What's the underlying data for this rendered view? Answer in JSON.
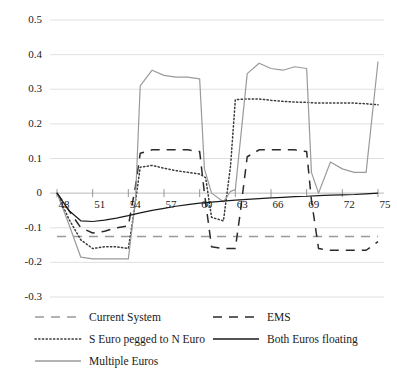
{
  "chart_data": {
    "type": "line",
    "title": "",
    "xlabel": "",
    "ylabel": "",
    "xlim": [
      48,
      75
    ],
    "ylim": [
      -0.3,
      0.5
    ],
    "grid": true,
    "legend_position": "bottom",
    "yticks": [
      "0.5",
      "0.4",
      "0.3",
      "0.2",
      "0.1",
      "0",
      "-0.1",
      "-0.2",
      "-0.3"
    ],
    "ytick_values": [
      0.5,
      0.4,
      0.3,
      0.2,
      0.1,
      0,
      -0.1,
      -0.2,
      -0.3
    ],
    "xticks": [
      "48",
      "51",
      "54",
      "57",
      "60",
      "63",
      "66",
      "69",
      "72",
      "75"
    ],
    "xtick_values": [
      48,
      51,
      54,
      57,
      60,
      63,
      66,
      69,
      72,
      75
    ],
    "series": [
      {
        "name": "Current System",
        "style": "dashed",
        "color": "#9a9a9a",
        "x": [
          48,
          75
        ],
        "values": [
          -0.125,
          -0.125
        ]
      },
      {
        "name": "EMS",
        "style": "dashed",
        "color": "#2b2b2b",
        "x": [
          48,
          49,
          50,
          51,
          52,
          53,
          54,
          54.6,
          55,
          56,
          57,
          58,
          59,
          60,
          60.4,
          61,
          62,
          63,
          63.4,
          64,
          65,
          66,
          67,
          68,
          69,
          69.4,
          70,
          71,
          72,
          73,
          74,
          75
        ],
        "values": [
          0,
          -0.05,
          -0.1,
          -0.115,
          -0.11,
          -0.1,
          -0.095,
          0.02,
          0.115,
          0.125,
          0.125,
          0.125,
          0.125,
          0.12,
          0.0,
          -0.155,
          -0.16,
          -0.16,
          -0.06,
          0.105,
          0.125,
          0.125,
          0.125,
          0.125,
          0.12,
          -0.02,
          -0.16,
          -0.165,
          -0.165,
          -0.165,
          -0.165,
          -0.14
        ]
      },
      {
        "name": "S Euro pegged to N Euro",
        "style": "dotted",
        "color": "#3a3a3a",
        "x": [
          48,
          49,
          50,
          51,
          52,
          53,
          54,
          54.5,
          55,
          56,
          57,
          58,
          59,
          60,
          60.5,
          61,
          62,
          62.6,
          63,
          64,
          65,
          66,
          67,
          68,
          69,
          70,
          71,
          72,
          73,
          74,
          75
        ],
        "values": [
          0,
          -0.075,
          -0.135,
          -0.16,
          -0.155,
          -0.155,
          -0.16,
          -0.05,
          0.075,
          0.08,
          0.072,
          0.065,
          0.06,
          0.055,
          0.045,
          -0.07,
          -0.08,
          0.08,
          0.27,
          0.272,
          0.272,
          0.268,
          0.265,
          0.263,
          0.262,
          0.26,
          0.26,
          0.26,
          0.26,
          0.258,
          0.255
        ]
      },
      {
        "name": "Multiple Euros",
        "style": "solid",
        "color": "#9a9a9a",
        "x": [
          48,
          49,
          50,
          51,
          52,
          53,
          54,
          54.6,
          55,
          56,
          57,
          58,
          59,
          60,
          60.4,
          61,
          62,
          62.6,
          63,
          64,
          65,
          66,
          67,
          68,
          69,
          69.4,
          70,
          71,
          72,
          73,
          74,
          75
        ],
        "values": [
          0,
          -0.09,
          -0.185,
          -0.19,
          -0.19,
          -0.19,
          -0.19,
          -0.02,
          0.31,
          0.355,
          0.34,
          0.335,
          0.335,
          0.33,
          0.07,
          0.0,
          -0.025,
          0.005,
          0.01,
          0.345,
          0.375,
          0.36,
          0.355,
          0.365,
          0.36,
          0.06,
          0.0,
          0.09,
          0.07,
          0.06,
          0.06,
          0.38
        ]
      },
      {
        "name": "Both Euros floating",
        "style": "solid",
        "color": "#1a1a1a",
        "x": [
          48,
          49,
          50,
          51,
          52,
          53,
          54,
          55,
          56,
          57,
          58,
          59,
          60,
          61,
          62,
          63,
          64,
          65,
          66,
          67,
          68,
          69,
          70,
          71,
          72,
          73,
          74,
          75
        ],
        "values": [
          0,
          -0.05,
          -0.08,
          -0.082,
          -0.078,
          -0.072,
          -0.065,
          -0.057,
          -0.05,
          -0.044,
          -0.038,
          -0.033,
          -0.029,
          -0.026,
          -0.023,
          -0.02,
          -0.018,
          -0.016,
          -0.014,
          -0.012,
          -0.01,
          -0.009,
          -0.007,
          -0.006,
          -0.005,
          -0.004,
          -0.002,
          0.0
        ]
      }
    ],
    "legend": [
      {
        "label": "Current System",
        "style": "dashed",
        "color": "#9a9a9a"
      },
      {
        "label": "EMS",
        "style": "dashed",
        "color": "#2b2b2b"
      },
      {
        "label": "S Euro pegged to N Euro",
        "style": "dotted",
        "color": "#3a3a3a"
      },
      {
        "label": "Both Euros floating",
        "style": "solid",
        "color": "#1a1a1a"
      },
      {
        "label": "Multiple Euros",
        "style": "solid",
        "color": "#9a9a9a"
      }
    ]
  }
}
